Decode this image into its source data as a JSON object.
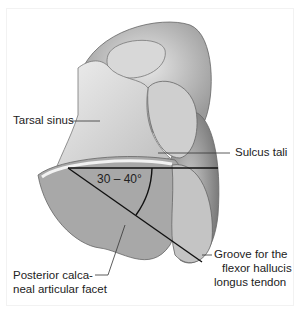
{
  "figure": {
    "labels": {
      "tarsal_sinus": "Tarsal sinus",
      "sulcus_tali": "Sulcus tali",
      "groove_line1": "Groove for the",
      "groove_line2": "flexor hallucis",
      "groove_line3": "longus tendon",
      "facet_line1": "Posterior calca-",
      "facet_line2": "neal articular facet"
    },
    "angle_label": "30 – 40°",
    "colors": {
      "bone_light": "#e6e6e6",
      "bone_mid": "#bdbdbd",
      "bone_dark": "#8a8a8a",
      "line": "#111111",
      "text": "#222222"
    }
  }
}
